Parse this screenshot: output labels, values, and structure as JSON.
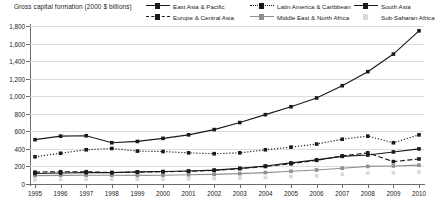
{
  "chart_data": {
    "type": "line",
    "title": "Gross capital formation (2000 $ billions)",
    "xlabel": "",
    "ylabel": "",
    "grid": true,
    "legend_position": "top-right",
    "ylim": [
      0,
      1800
    ],
    "ytick_step": 200,
    "ytick_labels": [
      "1,800",
      "1,600",
      "1,400",
      "1,200",
      "1,000",
      "800",
      "600",
      "400",
      "200",
      "0"
    ],
    "ytick_values": [
      1800,
      1600,
      1400,
      1200,
      1000,
      800,
      600,
      400,
      200,
      0
    ],
    "categories": [
      1995,
      1996,
      1997,
      1998,
      1999,
      2000,
      2001,
      2002,
      2003,
      2004,
      2005,
      2006,
      2007,
      2008,
      2009,
      2010
    ],
    "xtick_labels": [
      "1995",
      "1996",
      "1997",
      "1998",
      "1999",
      "2000",
      "2001",
      "2002",
      "2003",
      "2004",
      "2005",
      "2006",
      "2007",
      "2008",
      "2009",
      "2010"
    ],
    "series": [
      {
        "name": "East Asia & Pacific",
        "style": "solid",
        "color": "#1a1a1a",
        "marker": "square",
        "values": [
          505,
          545,
          550,
          470,
          485,
          520,
          560,
          620,
          700,
          790,
          880,
          980,
          1120,
          1280,
          1480,
          1745
        ]
      },
      {
        "name": "Europe & Central Asia",
        "style": "dashed",
        "color": "#1a1a1a",
        "marker": "square",
        "values": [
          135,
          140,
          140,
          130,
          135,
          140,
          145,
          155,
          175,
          200,
          230,
          270,
          320,
          355,
          255,
          285
        ]
      },
      {
        "name": "Latin America & Caribbean",
        "style": "dotted",
        "color": "#1a1a1a",
        "marker": "square",
        "values": [
          310,
          350,
          390,
          405,
          375,
          370,
          355,
          345,
          355,
          390,
          420,
          455,
          510,
          545,
          470,
          560
        ]
      },
      {
        "name": "Middle East & North Africa",
        "style": "solid",
        "color": "#8f8f8f",
        "marker": "square",
        "values": [
          95,
          98,
          100,
          100,
          98,
          100,
          105,
          110,
          118,
          130,
          145,
          160,
          180,
          200,
          205,
          215
        ]
      },
      {
        "name": "South Asia",
        "style": "solid",
        "color": "#1a1a1a",
        "marker": "square",
        "values": [
          120,
          125,
          130,
          130,
          138,
          142,
          148,
          158,
          178,
          205,
          240,
          275,
          315,
          330,
          365,
          400
        ]
      },
      {
        "name": "Sub-Saharan Africa",
        "style": "none",
        "color": "#d9d9d9",
        "marker": "square",
        "values": [
          48,
          50,
          53,
          55,
          55,
          55,
          58,
          62,
          68,
          75,
          85,
          95,
          110,
          125,
          128,
          135
        ]
      }
    ]
  },
  "legend": {
    "items": [
      {
        "label": "East Asia & Pacific",
        "key": "lk-solid"
      },
      {
        "label": "Latin America & Caribbean",
        "key": "lk-dotted"
      },
      {
        "label": "South Asia",
        "key": "lk-solid"
      },
      {
        "label": "Europe & Central Asia",
        "key": "lk-dashed"
      },
      {
        "label": "Middle East & North Africa",
        "key": "lk-solid-md"
      },
      {
        "label": "Sub-Saharan Africa",
        "key": "lk-none"
      }
    ]
  }
}
